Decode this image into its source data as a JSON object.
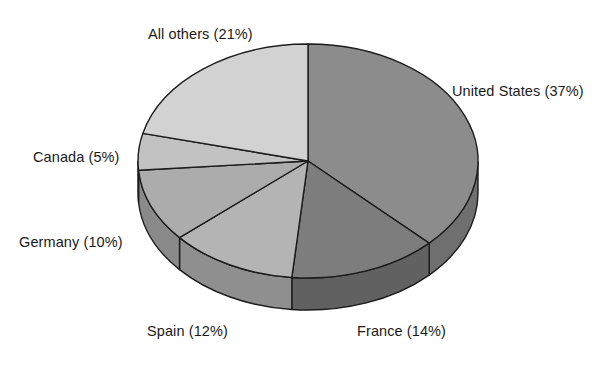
{
  "chart_data": {
    "type": "pie",
    "title": "",
    "subtitle": "",
    "xlabel": "",
    "ylabel": "",
    "units": "percent",
    "legend_position": "none",
    "labels_position": "outside",
    "grid": false,
    "three_d": true,
    "start_angle_deg": 0,
    "direction": "clockwise",
    "categories": [
      "United States",
      "France",
      "Spain",
      "Germany",
      "Canada",
      "All others"
    ],
    "values": [
      37,
      14,
      12,
      10,
      5,
      21
    ],
    "slices": [
      {
        "name": "United States",
        "value": 37,
        "label": "United States (37%)",
        "percent_text": "(37%)",
        "color": "#8c8c8c",
        "side_color": "#6f6f6f"
      },
      {
        "name": "France",
        "value": 14,
        "label": "France (14%)",
        "percent_text": "(14%)",
        "color": "#7d7d7d",
        "side_color": "#616161"
      },
      {
        "name": "Spain",
        "value": 12,
        "label": "Spain (12%)",
        "percent_text": "(12%)",
        "color": "#b4b4b4",
        "side_color": "#8f8f8f"
      },
      {
        "name": "Germany",
        "value": 10,
        "label": "Germany (10%)",
        "percent_text": "(10%)",
        "color": "#acacac",
        "side_color": "#8a8a8a"
      },
      {
        "name": "Canada",
        "value": 5,
        "label": "Canada (5%)",
        "percent_text": "(5%)",
        "color": "#c2c2c2",
        "side_color": "#9b9b9b"
      },
      {
        "name": "All others",
        "value": 21,
        "label": "All others (21%)",
        "percent_text": "(21%)",
        "color": "#d2d2d2",
        "side_color": "#a8a8a8"
      }
    ]
  },
  "colors": {
    "background": "#ffffff",
    "outline": "#1c1c1c",
    "text": "#1a1a1a"
  },
  "labels": {
    "all_others": "All others (21%)",
    "united_states": "United States (37%)",
    "canada": "Canada (5%)",
    "germany": "Germany (10%)",
    "spain": "Spain (12%)",
    "france": "France (14%)"
  }
}
